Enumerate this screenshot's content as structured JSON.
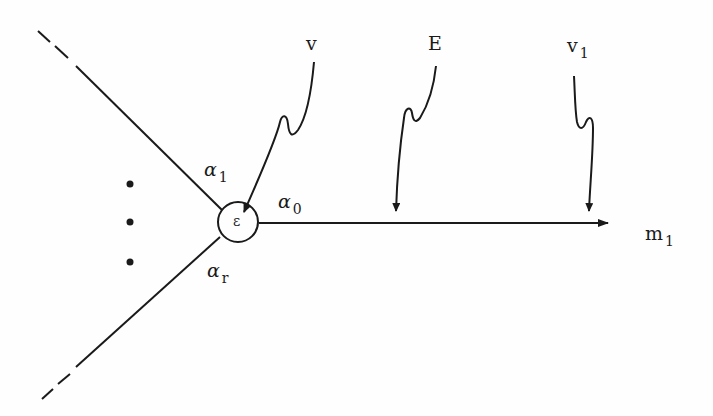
{
  "diagram": {
    "stroke_color": "#1a1a1a",
    "background": "#fefefe",
    "vertex": {
      "label": "ε"
    },
    "edges": {
      "incoming_top": {
        "label": "α",
        "subscript": "1"
      },
      "incoming_bottom": {
        "label": "α",
        "subscript": "r"
      },
      "outgoing": {
        "label": "α",
        "subscript": "0"
      }
    },
    "ellipsis_dots": 3,
    "outgoing_endpoint": {
      "label": "m",
      "subscript": "1"
    },
    "wavy_arrows": [
      {
        "label": "v",
        "subscript": ""
      },
      {
        "label": "E",
        "subscript": ""
      },
      {
        "label": "v",
        "subscript": "1"
      }
    ]
  }
}
